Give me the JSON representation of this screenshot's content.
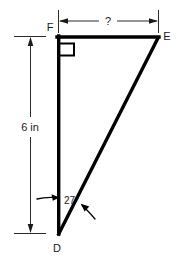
{
  "figure": {
    "type": "right-triangle-diagram",
    "background_color": "#ffffff",
    "line_color": "#000000",
    "vertices": [
      {
        "id": "F",
        "label": "F",
        "x": 58,
        "y": 36,
        "label_x": 50,
        "label_y": 30
      },
      {
        "id": "E",
        "label": "E",
        "x": 158,
        "y": 36,
        "label_x": 164,
        "label_y": 40
      },
      {
        "id": "D",
        "label": "D",
        "x": 58,
        "y": 233,
        "label_x": 55,
        "label_y": 250
      }
    ],
    "right_angle": {
      "at_vertex": "F",
      "marker": "square",
      "size": 13
    },
    "angle_measure": {
      "at_vertex": "D",
      "value": "27",
      "unit": "degrees",
      "text": "27°",
      "label_x": 64,
      "label_y": 204
    },
    "dimensions": [
      {
        "name": "vertical-leg",
        "edge": "DF",
        "label": "6 in",
        "orientation": "vertical",
        "position": "left",
        "line_x": 30,
        "from_y": 36,
        "to_y": 233,
        "label_x": 30,
        "label_y": 128
      },
      {
        "name": "horizontal-leg",
        "edge": "FE",
        "label": "?",
        "orientation": "horizontal",
        "position": "top",
        "line_y": 21,
        "from_x": 58,
        "to_x": 158,
        "label_x": 108,
        "label_y": 25
      }
    ],
    "edges": [
      {
        "name": "FE",
        "from": "F",
        "to": "E",
        "style": "solid"
      },
      {
        "name": "FD",
        "from": "F",
        "to": "D",
        "style": "solid"
      },
      {
        "name": "DE",
        "from": "D",
        "to": "E",
        "style": "solid"
      }
    ]
  }
}
